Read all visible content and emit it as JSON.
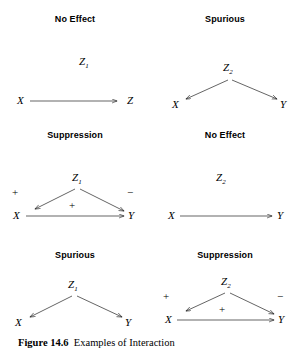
{
  "figure": {
    "caption_number": "Figure 14.6",
    "caption_text": "Examples of Interaction",
    "background_color": "#ffffff",
    "stroke_color": "#222222"
  },
  "panels": [
    {
      "id": "top-left",
      "title": "No Effect",
      "pattern": "no-effect",
      "nodes": [
        {
          "name": "z",
          "label": "Z",
          "subscript": "1"
        },
        {
          "name": "x",
          "label": "X",
          "subscript": ""
        },
        {
          "name": "y",
          "label": "Z",
          "subscript": ""
        }
      ],
      "edges": [
        {
          "from": "X",
          "to": "Z",
          "sign": ""
        }
      ],
      "signs": []
    },
    {
      "id": "top-right",
      "title": "Spurious",
      "pattern": "spurious",
      "nodes": [
        {
          "name": "z",
          "label": "Z",
          "subscript": "2"
        },
        {
          "name": "x",
          "label": "X",
          "subscript": ""
        },
        {
          "name": "y",
          "label": "Y",
          "subscript": ""
        }
      ],
      "edges": [
        {
          "from": "Z2",
          "to": "X",
          "sign": ""
        },
        {
          "from": "Z2",
          "to": "Y",
          "sign": ""
        }
      ],
      "signs": []
    },
    {
      "id": "middle-left",
      "title": "Suppression",
      "pattern": "suppression",
      "nodes": [
        {
          "name": "z",
          "label": "Z",
          "subscript": "1"
        },
        {
          "name": "x",
          "label": "X",
          "subscript": ""
        },
        {
          "name": "y",
          "label": "Y",
          "subscript": ""
        }
      ],
      "edges": [
        {
          "from": "Z1",
          "to": "X",
          "sign": "+"
        },
        {
          "from": "Z1",
          "to": "Y",
          "sign": "−"
        },
        {
          "from": "X",
          "to": "Y",
          "sign": "+"
        }
      ],
      "signs": [
        {
          "name": "sign-left",
          "value": "+"
        },
        {
          "name": "sign-right",
          "value": "−"
        },
        {
          "name": "sign-center",
          "value": "+"
        }
      ]
    },
    {
      "id": "middle-right",
      "title": "No Effect",
      "pattern": "no-effect",
      "nodes": [
        {
          "name": "z",
          "label": "Z",
          "subscript": "2"
        },
        {
          "name": "x",
          "label": "X",
          "subscript": ""
        },
        {
          "name": "y",
          "label": "Y",
          "subscript": ""
        }
      ],
      "edges": [
        {
          "from": "X",
          "to": "Y",
          "sign": ""
        }
      ],
      "signs": []
    },
    {
      "id": "bottom-left",
      "title": "Spurious",
      "pattern": "spurious",
      "nodes": [
        {
          "name": "z",
          "label": "Z",
          "subscript": "1"
        },
        {
          "name": "x",
          "label": "X",
          "subscript": ""
        },
        {
          "name": "y",
          "label": "Y",
          "subscript": ""
        }
      ],
      "edges": [
        {
          "from": "Z1",
          "to": "X",
          "sign": ""
        },
        {
          "from": "Z1",
          "to": "Y",
          "sign": ""
        }
      ],
      "signs": []
    },
    {
      "id": "bottom-right",
      "title": "Suppression",
      "pattern": "suppression",
      "nodes": [
        {
          "name": "z",
          "label": "Z",
          "subscript": "2"
        },
        {
          "name": "x",
          "label": "X",
          "subscript": ""
        },
        {
          "name": "y",
          "label": "Y",
          "subscript": ""
        }
      ],
      "edges": [
        {
          "from": "Z2",
          "to": "X",
          "sign": "+"
        },
        {
          "from": "Z2",
          "to": "Y",
          "sign": "−"
        },
        {
          "from": "X",
          "to": "Y",
          "sign": "+"
        }
      ],
      "signs": [
        {
          "name": "sign-left",
          "value": "+"
        },
        {
          "name": "sign-right",
          "value": "−"
        },
        {
          "name": "sign-center",
          "value": "+"
        }
      ]
    }
  ]
}
